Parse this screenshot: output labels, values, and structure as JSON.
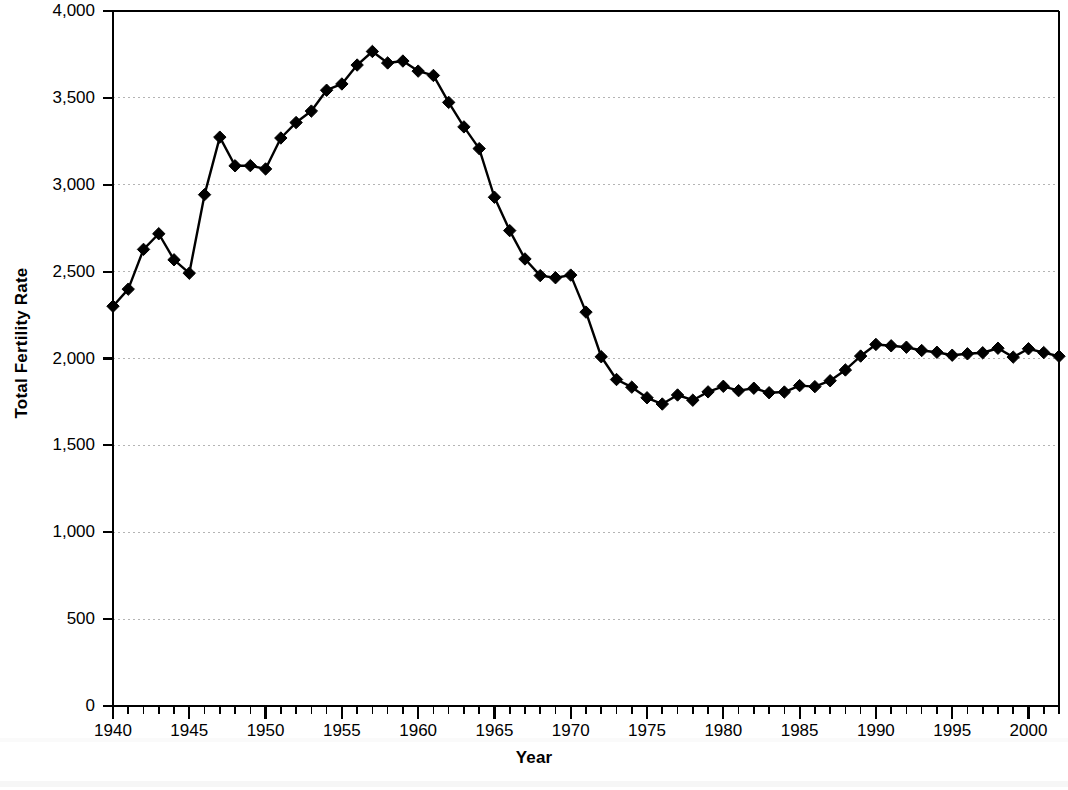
{
  "chart_data": {
    "type": "line",
    "title": "",
    "xlabel": "Year",
    "ylabel": "Total Fertility Rate",
    "xlim": [
      1940,
      2002
    ],
    "ylim": [
      0,
      4000
    ],
    "grid": true,
    "legend": null,
    "marker": "diamond",
    "line_color": "#000000",
    "marker_color": "#000000",
    "grid_color": "#b4b4b4",
    "axis_color": "#000000",
    "background": "#ffffff",
    "y_ticks": [
      0,
      500,
      1000,
      1500,
      2000,
      2500,
      3000,
      3500,
      4000
    ],
    "y_tick_labels": [
      "0",
      "500",
      "1,000",
      "1,500",
      "2,000",
      "2,500",
      "3,000",
      "3,500",
      "4,000"
    ],
    "x_ticks": [
      1940,
      1945,
      1950,
      1955,
      1960,
      1965,
      1970,
      1975,
      1980,
      1985,
      1990,
      1995,
      2000
    ],
    "x_tick_labels": [
      "1940",
      "1945",
      "1950",
      "1955",
      "1960",
      "1965",
      "1970",
      "1975",
      "1980",
      "1985",
      "1990",
      "1995",
      "2000"
    ],
    "x_minor_tick_step": 1,
    "x": [
      1940,
      1941,
      1942,
      1943,
      1944,
      1945,
      1946,
      1947,
      1948,
      1949,
      1950,
      1951,
      1952,
      1953,
      1954,
      1955,
      1956,
      1957,
      1958,
      1959,
      1960,
      1961,
      1962,
      1963,
      1964,
      1965,
      1966,
      1967,
      1968,
      1969,
      1970,
      1971,
      1972,
      1973,
      1974,
      1975,
      1976,
      1977,
      1978,
      1979,
      1980,
      1981,
      1982,
      1983,
      1984,
      1985,
      1986,
      1987,
      1988,
      1989,
      1990,
      1991,
      1992,
      1993,
      1994,
      1995,
      1996,
      1997,
      1998,
      1999,
      2000,
      2001,
      2002
    ],
    "y": [
      2301,
      2399,
      2628,
      2718,
      2568,
      2491,
      2943,
      3274,
      3109,
      3110,
      3091,
      3269,
      3358,
      3424,
      3544,
      3580,
      3689,
      3767,
      3701,
      3712,
      3654,
      3629,
      3474,
      3333,
      3208,
      2928,
      2736,
      2573,
      2477,
      2465,
      2480,
      2267,
      2010,
      1879,
      1835,
      1774,
      1738,
      1790,
      1760,
      1808,
      1840,
      1815,
      1829,
      1803,
      1807,
      1844,
      1838,
      1872,
      1934,
      2014,
      2081,
      2073,
      2065,
      2046,
      2036,
      2019,
      2027,
      2033,
      2059,
      2008,
      2056,
      2034,
      2013
    ],
    "series_name": "Total fertility rate",
    "n_points": 63,
    "annotations": []
  },
  "figure": {
    "axis_title_x": "Year",
    "axis_title_y": "Total Fertility Rate"
  }
}
